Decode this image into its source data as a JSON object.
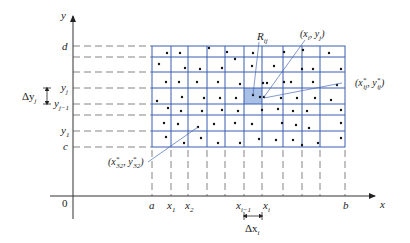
{
  "diagram": {
    "colors": {
      "grid": "#3a5fb0",
      "shaded_cell": "#a8bfe6",
      "axis": "#333333",
      "dashed": "#555555",
      "leader": "#4a6ab8",
      "dot": "#111111"
    },
    "axes": {
      "x_label": "x",
      "y_label": "y",
      "origin_label": "0"
    },
    "x_ticks": [
      {
        "label": "a",
        "sub": ""
      },
      {
        "label": "x",
        "sub": "1"
      },
      {
        "label": "x",
        "sub": "2"
      },
      {
        "label": "x",
        "sub": "i−1"
      },
      {
        "label": "x",
        "sub": "i"
      },
      {
        "label": "b",
        "sub": ""
      }
    ],
    "y_ticks": [
      {
        "label": "d",
        "sub": ""
      },
      {
        "label": "y",
        "sub": "j"
      },
      {
        "label": "y",
        "sub": "j−1"
      },
      {
        "label": "y",
        "sub": "1"
      },
      {
        "label": "c",
        "sub": ""
      }
    ],
    "annotations": {
      "region": "R",
      "region_sub": "ij",
      "corner_point": "(x_i, y_j)",
      "sample_point": "(x*_ij, y*_ij)",
      "sample_point_32": "(x*_32, y*_32)",
      "delta_x": "Δx",
      "delta_x_sub": "i",
      "delta_y": "Δy",
      "delta_y_sub": "j"
    }
  }
}
